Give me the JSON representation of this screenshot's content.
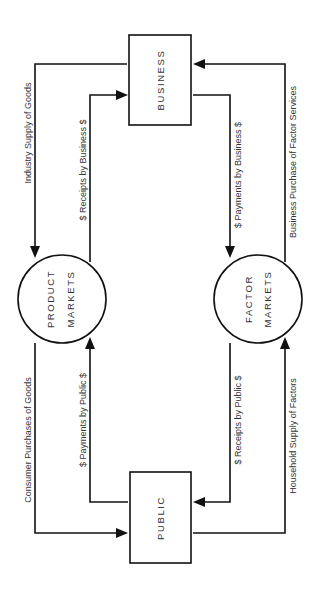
{
  "diagram": {
    "nodes": {
      "business": {
        "label": "BUSINESS",
        "shape": "rectangle"
      },
      "public": {
        "label": "PUBLIC",
        "shape": "rectangle"
      },
      "product_markets": {
        "label_line1": "PRODUCT",
        "label_line2": "MARKETS",
        "shape": "circle"
      },
      "factor_markets": {
        "label_line1": "FACTOR",
        "label_line2": "MARKETS",
        "shape": "circle"
      }
    },
    "flows": {
      "industry_supply": {
        "label": "Industry Supply of Goods",
        "from": "BUSINESS",
        "to": "PRODUCT MARKETS"
      },
      "consumer_purchases": {
        "label": "Consumer Purchases of Goods",
        "from": "PRODUCT MARKETS",
        "to": "PUBLIC"
      },
      "receipts_by_business": {
        "label": "$  Receipts by Business  $",
        "from": "PRODUCT MARKETS",
        "to": "BUSINESS"
      },
      "payments_by_public": {
        "label": "$  Payments by Public  $",
        "from": "PUBLIC",
        "to": "PRODUCT MARKETS"
      },
      "payments_by_business": {
        "label": "$  Payments by Business  $",
        "from": "BUSINESS",
        "to": "FACTOR MARKETS"
      },
      "receipts_by_public": {
        "label": "$  Receipts by Public  $",
        "from": "FACTOR MARKETS",
        "to": "PUBLIC"
      },
      "business_purchase": {
        "label": "Business Purchase of Factor Services",
        "from": "FACTOR MARKETS",
        "to": "BUSINESS"
      },
      "household_supply": {
        "label": "Household Supply of Factors",
        "from": "PUBLIC",
        "to": "FACTOR MARKETS"
      }
    },
    "colors": {
      "stroke": "#111111",
      "text": "#333333",
      "background": "#ffffff"
    }
  }
}
